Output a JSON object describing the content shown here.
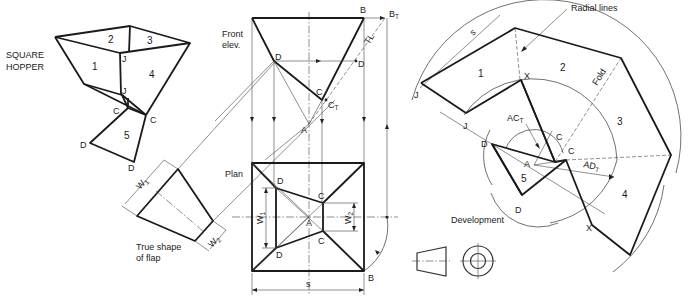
{
  "title_cropped": "",
  "hopper": {
    "title_line1": "SQUARE",
    "title_line2": "HOPPER",
    "faces": [
      "1",
      "2",
      "3",
      "4",
      "5"
    ],
    "points": {
      "J1": "J",
      "J2": "J",
      "C1": "C",
      "C2": "C",
      "D1": "D",
      "D2": "D"
    }
  },
  "true_shape": {
    "caption_line1": "True shape",
    "caption_line2": "of flap",
    "w1": "W",
    "w1_sub": "1",
    "w2": "W",
    "w2_sub": "2"
  },
  "front_elev": {
    "caption_line1": "Front",
    "caption_line2": "elev.",
    "B": "B",
    "BT": "B",
    "BT_sub": "T",
    "TL": "TL",
    "D1": "D",
    "D2": "D",
    "C": "C",
    "CT": "C",
    "CT_sub": "T",
    "A": "A"
  },
  "plan": {
    "caption": "Plan",
    "D_top": "D",
    "D_bot": "D",
    "C_top": "C",
    "C_bot": "C",
    "A": "A",
    "B": "B",
    "w1": "W",
    "w1_sub": "1",
    "w2": "W",
    "w2_sub": "2",
    "s": "s"
  },
  "development": {
    "caption": "Development",
    "radial_lines": "Radial lines",
    "fold": "Fold",
    "s": "s",
    "faces": [
      "1",
      "2",
      "3",
      "4",
      "5"
    ],
    "J1": "J",
    "J2": "J",
    "X1": "X",
    "X2": "X",
    "C1": "C",
    "C2": "C",
    "D1": "D",
    "D2": "D",
    "A": "A",
    "ac": "AC",
    "ac_sub": "T",
    "ad": "AD",
    "ad_sub": "T"
  },
  "projection_symbol": {
    "icon": "third-angle-projection-icon"
  }
}
